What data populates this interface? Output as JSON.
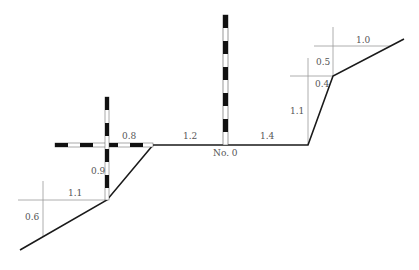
{
  "diagram": {
    "type": "road cross-section survey",
    "station_label": "No. 0",
    "profile_points": [
      [
        20,
        250
      ],
      [
        107,
        200
      ],
      [
        153,
        145
      ],
      [
        308,
        145
      ],
      [
        333,
        76
      ],
      [
        404,
        39
      ]
    ],
    "dimensions": [
      {
        "id": "left-lower-slope-vertical",
        "text": "0.6",
        "x": 25,
        "y": 220
      },
      {
        "id": "left-lower-slope-horizontal",
        "text": "1.1",
        "x": 68,
        "y": 196
      },
      {
        "id": "left-upper-slope-vertical",
        "text": "0.9",
        "x": 91,
        "y": 174
      },
      {
        "id": "left-upper-slope-horizontal",
        "text": "0.8",
        "x": 122,
        "y": 139
      },
      {
        "id": "road-left-width",
        "text": "1.2",
        "x": 183,
        "y": 139
      },
      {
        "id": "road-right-width",
        "text": "1.4",
        "x": 260,
        "y": 139
      },
      {
        "id": "right-lower-slope-vertical",
        "text": "1.1",
        "x": 290,
        "y": 114
      },
      {
        "id": "right-step-vertical",
        "text": "0.4",
        "x": 315,
        "y": 87
      },
      {
        "id": "right-upper-slope-vertical",
        "text": "0.5",
        "x": 316,
        "y": 65
      },
      {
        "id": "right-upper-slope-horizontal",
        "text": "1.0",
        "x": 356,
        "y": 43
      }
    ],
    "colors": {
      "profile": "#1a1a1a",
      "dimension_lines": "#999999",
      "pole_dark": "#111111",
      "pole_light": "#ffffff",
      "text": "#555555"
    }
  }
}
